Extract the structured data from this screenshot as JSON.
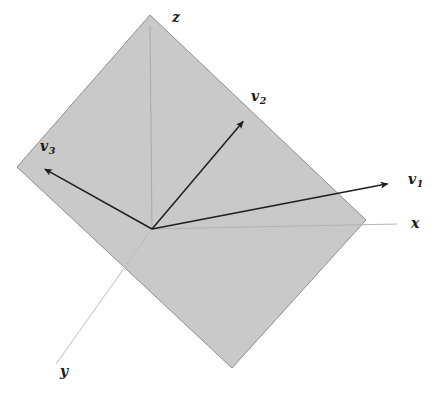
{
  "figure": {
    "width": 437,
    "height": 394,
    "background_color": "#ffffff"
  },
  "plane": {
    "name": "shaded-plane",
    "fill_color": "#c9c9c9",
    "stroke_color": "#8f8f8f",
    "vertices": [
      {
        "x": 150,
        "y": 15
      },
      {
        "x": 366,
        "y": 220
      },
      {
        "x": 232,
        "y": 368
      },
      {
        "x": 17,
        "y": 167
      }
    ]
  },
  "origin": {
    "x": 152,
    "y": 229
  },
  "axes": {
    "color": "#b0b0b0",
    "items": [
      {
        "id": "z",
        "label": "z",
        "from": {
          "x": 152,
          "y": 229
        },
        "to": {
          "x": 150,
          "y": 26
        }
      },
      {
        "id": "x",
        "label": "x",
        "from": {
          "x": 152,
          "y": 229
        },
        "to": {
          "x": 397,
          "y": 224
        }
      },
      {
        "id": "y",
        "label": "y",
        "from": {
          "x": 152,
          "y": 229
        },
        "to": {
          "x": 56,
          "y": 364
        }
      }
    ]
  },
  "vectors": {
    "color": "#1f1f1f",
    "items": [
      {
        "id": "v1",
        "label": "v",
        "subscript": "1",
        "from": {
          "x": 152,
          "y": 229
        },
        "to": {
          "x": 392,
          "y": 183
        }
      },
      {
        "id": "v2",
        "label": "v",
        "subscript": "2",
        "from": {
          "x": 152,
          "y": 229
        },
        "to": {
          "x": 246,
          "y": 118
        }
      },
      {
        "id": "v3",
        "label": "v",
        "subscript": "3",
        "from": {
          "x": 152,
          "y": 229
        },
        "to": {
          "x": 41,
          "y": 167
        }
      }
    ]
  },
  "labels": {
    "z": "z",
    "x": "x",
    "y": "y",
    "v1_base": "v",
    "v1_sub": "1",
    "v2_base": "v",
    "v2_sub": "2",
    "v3_base": "v",
    "v3_sub": "3"
  }
}
